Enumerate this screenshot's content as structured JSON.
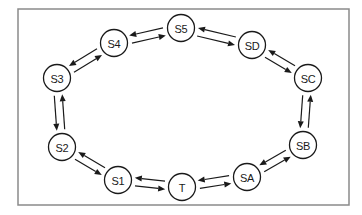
{
  "diagram": {
    "type": "state-cycle",
    "frame": {
      "x": 18,
      "y": 9,
      "width": 331,
      "height": 196,
      "stroke": "#8a8a8a"
    },
    "node_radius": 13.5,
    "colors": {
      "stroke": "#1a1a1a",
      "fill": "#ffffff",
      "frame": "#8a8a8a"
    },
    "nodes": [
      {
        "id": "S5",
        "label": "S5",
        "x": 181,
        "y": 28
      },
      {
        "id": "SD",
        "label": "SD",
        "x": 252,
        "y": 45
      },
      {
        "id": "SC",
        "label": "SC",
        "x": 308,
        "y": 78
      },
      {
        "id": "SB",
        "label": "SB",
        "x": 303,
        "y": 145
      },
      {
        "id": "SA",
        "label": "SA",
        "x": 247,
        "y": 177
      },
      {
        "id": "T",
        "label": "T",
        "x": 182,
        "y": 187
      },
      {
        "id": "S1",
        "label": "S1",
        "x": 118,
        "y": 180
      },
      {
        "id": "S2",
        "label": "S2",
        "x": 62,
        "y": 147
      },
      {
        "id": "S3",
        "label": "S3",
        "x": 57,
        "y": 78
      },
      {
        "id": "S4",
        "label": "S4",
        "x": 114,
        "y": 43
      }
    ],
    "edges": [
      {
        "from": "S4",
        "to": "S5"
      },
      {
        "from": "S5",
        "to": "S4"
      },
      {
        "from": "S5",
        "to": "SD"
      },
      {
        "from": "SD",
        "to": "S5"
      },
      {
        "from": "SD",
        "to": "SC"
      },
      {
        "from": "SC",
        "to": "SD"
      },
      {
        "from": "SC",
        "to": "SB"
      },
      {
        "from": "SB",
        "to": "SC"
      },
      {
        "from": "SB",
        "to": "SA"
      },
      {
        "from": "SA",
        "to": "SB"
      },
      {
        "from": "SA",
        "to": "T"
      },
      {
        "from": "T",
        "to": "SA"
      },
      {
        "from": "T",
        "to": "S1"
      },
      {
        "from": "S1",
        "to": "T"
      },
      {
        "from": "S1",
        "to": "S2"
      },
      {
        "from": "S2",
        "to": "S1"
      },
      {
        "from": "S2",
        "to": "S3"
      },
      {
        "from": "S3",
        "to": "S2"
      },
      {
        "from": "S3",
        "to": "S4"
      },
      {
        "from": "S4",
        "to": "S3"
      }
    ]
  }
}
